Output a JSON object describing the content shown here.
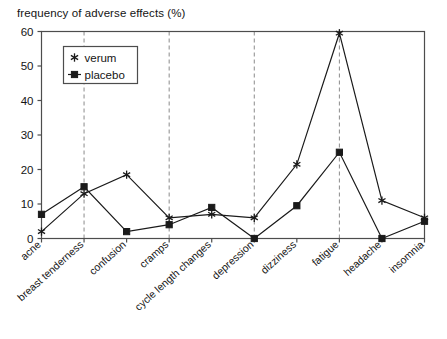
{
  "chart_data": {
    "type": "line",
    "title": "frequency of adverse effects (%)",
    "xlabel": "",
    "ylabel": "",
    "ylim": [
      0,
      60
    ],
    "yticks": [
      0,
      10,
      20,
      30,
      40,
      50,
      60
    ],
    "grid": "vertical-dashed",
    "legend_position": "upper-left-inside",
    "categories": [
      "acne",
      "breast tenderness",
      "confusion",
      "cramps",
      "cycle length changes",
      "depression",
      "dizziness",
      "fatigue",
      "headache",
      "insomnia"
    ],
    "series": [
      {
        "name": "verum",
        "marker": "asterisk",
        "color": "#1a1a1a",
        "values": [
          2,
          13,
          18.5,
          6,
          7,
          6,
          21.5,
          59.5,
          11,
          6
        ]
      },
      {
        "name": "placebo",
        "marker": "square",
        "color": "#1a1a1a",
        "values": [
          7,
          15,
          2,
          4,
          9,
          0,
          9.5,
          25,
          0,
          5
        ]
      }
    ]
  },
  "legend": {
    "entries": [
      {
        "label": "verum"
      },
      {
        "label": "placebo"
      }
    ]
  },
  "axis": {
    "y_tick_labels": [
      "0",
      "10",
      "20",
      "30",
      "40",
      "50",
      "60"
    ]
  }
}
